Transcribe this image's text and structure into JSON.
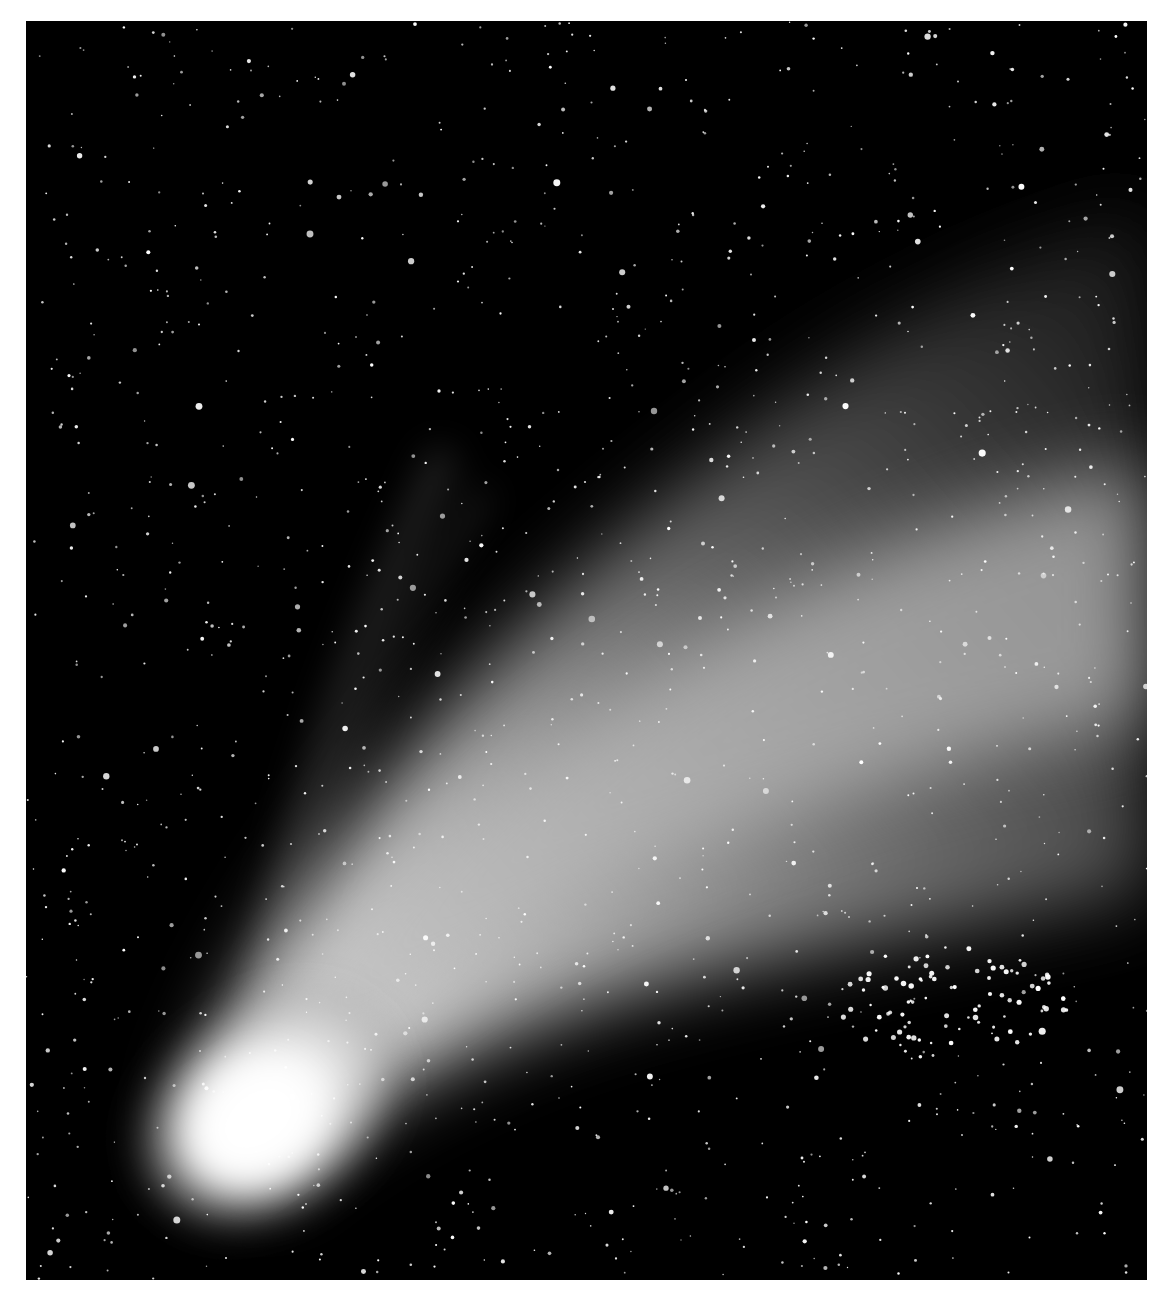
{
  "image": {
    "subject": "Comet with broad dust tail against starfield",
    "alt": "Bright comet with a large, sweeping white dust tail extending from lower-left toward upper-right across a dense field of stars",
    "colors": {
      "sky": "#000000",
      "coma": "#ffffff",
      "tail": "#9a9a9a",
      "border": "#ffffff"
    },
    "frame": {
      "left": 26,
      "top": 21,
      "width": 1121,
      "height": 1259
    }
  }
}
